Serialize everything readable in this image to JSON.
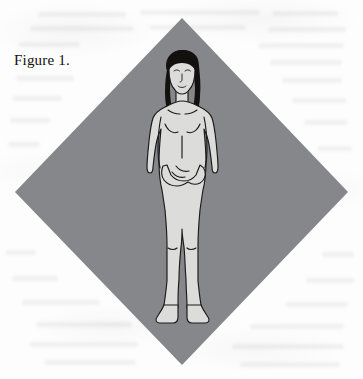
{
  "page": {
    "background_color": "#fdfdfd",
    "width": 363,
    "height": 379
  },
  "caption": {
    "text": "Figure 1."
  },
  "figure": {
    "name": "anatomical-standing-figure",
    "backdrop_shape": "diamond",
    "colors": {
      "diamond_fill": "#85878a",
      "skin_fill": "#dcdcda",
      "outline": "#1a1a1a",
      "hair_fill": "#13110f"
    },
    "diamond_vertices": {
      "top": [
        182,
        18
      ],
      "right": [
        348,
        192
      ],
      "bottom": [
        182,
        365
      ],
      "left": [
        15,
        192
      ]
    }
  },
  "ghost_text_rows": [
    {
      "x": 38,
      "y": 12,
      "w": 88
    },
    {
      "x": 140,
      "y": 10,
      "w": 120
    },
    {
      "x": 272,
      "y": 11,
      "w": 66
    },
    {
      "x": 30,
      "y": 26,
      "w": 104
    },
    {
      "x": 150,
      "y": 25,
      "w": 96
    },
    {
      "x": 268,
      "y": 27,
      "w": 78
    },
    {
      "x": 18,
      "y": 42,
      "w": 62
    },
    {
      "x": 258,
      "y": 43,
      "w": 86
    },
    {
      "x": 14,
      "y": 58,
      "w": 0
    },
    {
      "x": 270,
      "y": 60,
      "w": 72
    },
    {
      "x": 16,
      "y": 76,
      "w": 58
    },
    {
      "x": 282,
      "y": 78,
      "w": 60
    },
    {
      "x": 12,
      "y": 96,
      "w": 50
    },
    {
      "x": 292,
      "y": 98,
      "w": 54
    },
    {
      "x": 10,
      "y": 118,
      "w": 40
    },
    {
      "x": 304,
      "y": 120,
      "w": 44
    },
    {
      "x": 8,
      "y": 142,
      "w": 32
    },
    {
      "x": 318,
      "y": 146,
      "w": 34
    },
    {
      "x": 6,
      "y": 250,
      "w": 30
    },
    {
      "x": 322,
      "y": 252,
      "w": 32
    },
    {
      "x": 12,
      "y": 276,
      "w": 46
    },
    {
      "x": 306,
      "y": 278,
      "w": 48
    },
    {
      "x": 22,
      "y": 300,
      "w": 78
    },
    {
      "x": 286,
      "y": 302,
      "w": 62
    },
    {
      "x": 36,
      "y": 322,
      "w": 96
    },
    {
      "x": 250,
      "y": 324,
      "w": 94
    },
    {
      "x": 30,
      "y": 342,
      "w": 108
    },
    {
      "x": 232,
      "y": 344,
      "w": 112
    },
    {
      "x": 44,
      "y": 360,
      "w": 92
    },
    {
      "x": 240,
      "y": 362,
      "w": 100
    }
  ]
}
